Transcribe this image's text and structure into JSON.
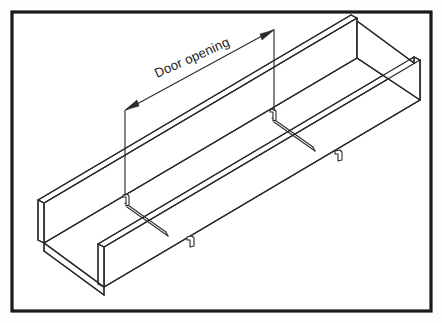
{
  "figure": {
    "background_color": "#fdfdfc",
    "line_color": "#2b2b2b",
    "border_color": "#1a1a1a"
  },
  "annotations": {
    "dimension_label": "Door opening",
    "dimension_label_rotation_deg": -24
  },
  "drawing": {
    "object_name": "cable-tray",
    "view": "isometric",
    "rung_count": 2,
    "clip_count": 2
  }
}
